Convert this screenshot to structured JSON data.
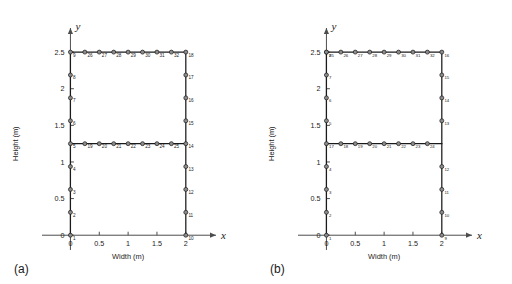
{
  "figure": {
    "type": "engineering-mesh-diagram",
    "panels": [
      {
        "tag": "(a)",
        "x_axis": {
          "letter": "x",
          "title": "Width (m)",
          "ticks": [
            "0",
            "0.5",
            "1",
            "1.5",
            "2"
          ],
          "tick_values": [
            0,
            0.5,
            1,
            1.5,
            2
          ],
          "range": [
            -0.25,
            2.35
          ]
        },
        "y_axis": {
          "letter": "y",
          "title": "Height (m)",
          "ticks": [
            "0",
            "0.5",
            "1",
            "1.5",
            "2",
            "2.5"
          ],
          "tick_values": [
            0,
            0.5,
            1,
            1.5,
            2,
            2.5
          ],
          "range": [
            -0.12,
            2.72
          ]
        },
        "nodes": [
          {
            "label": "1",
            "x": 0,
            "y": 0.0
          },
          {
            "label": "2",
            "x": 0,
            "y": 0.3125
          },
          {
            "label": "3",
            "x": 0,
            "y": 0.625
          },
          {
            "label": "4",
            "x": 0,
            "y": 0.9375
          },
          {
            "label": "5",
            "x": 0,
            "y": 1.25
          },
          {
            "label": "6",
            "x": 0,
            "y": 1.5625
          },
          {
            "label": "7",
            "x": 0,
            "y": 1.875
          },
          {
            "label": "8",
            "x": 0,
            "y": 2.1875
          },
          {
            "label": "9",
            "x": 0,
            "y": 2.5
          },
          {
            "label": "10",
            "x": 2,
            "y": 0.0
          },
          {
            "label": "11",
            "x": 2,
            "y": 0.3125
          },
          {
            "label": "12",
            "x": 2,
            "y": 0.625
          },
          {
            "label": "13",
            "x": 2,
            "y": 0.9375
          },
          {
            "label": "14",
            "x": 2,
            "y": 1.25
          },
          {
            "label": "15",
            "x": 2,
            "y": 1.5625
          },
          {
            "label": "16",
            "x": 2,
            "y": 1.875
          },
          {
            "label": "17",
            "x": 2,
            "y": 2.1875
          },
          {
            "label": "18",
            "x": 2,
            "y": 2.5
          },
          {
            "label": "19",
            "x": 0.25,
            "y": 1.25
          },
          {
            "label": "20",
            "x": 0.5,
            "y": 1.25
          },
          {
            "label": "21",
            "x": 0.75,
            "y": 1.25
          },
          {
            "label": "22",
            "x": 1.0,
            "y": 1.25
          },
          {
            "label": "23",
            "x": 1.25,
            "y": 1.25
          },
          {
            "label": "24",
            "x": 1.5,
            "y": 1.25
          },
          {
            "label": "25",
            "x": 1.75,
            "y": 1.25
          },
          {
            "label": "26",
            "x": 0.25,
            "y": 2.5
          },
          {
            "label": "27",
            "x": 0.5,
            "y": 2.5
          },
          {
            "label": "28",
            "x": 0.75,
            "y": 2.5
          },
          {
            "label": "29",
            "x": 1.0,
            "y": 2.5
          },
          {
            "label": "30",
            "x": 1.25,
            "y": 2.5
          },
          {
            "label": "31",
            "x": 1.5,
            "y": 2.5
          },
          {
            "label": "32",
            "x": 1.75,
            "y": 2.5
          }
        ],
        "members": [
          {
            "x1": 0,
            "y1": 0,
            "x2": 0,
            "y2": 2.5
          },
          {
            "x1": 2,
            "y1": 0,
            "x2": 2,
            "y2": 2.5
          },
          {
            "x1": 0,
            "y1": 1.25,
            "x2": 2,
            "y2": 1.25
          },
          {
            "x1": 0,
            "y1": 2.5,
            "x2": 2,
            "y2": 2.5
          }
        ]
      },
      {
        "tag": "(b)",
        "x_axis": {
          "letter": "x",
          "title": "Width (m)",
          "ticks": [
            "0",
            "0.5",
            "1",
            "1.5",
            "2"
          ],
          "tick_values": [
            0,
            0.5,
            1,
            1.5,
            2
          ],
          "range": [
            -0.25,
            2.35
          ]
        },
        "y_axis": {
          "letter": "y",
          "title": "Height (m)",
          "ticks": [
            "0",
            "0.5",
            "1",
            "1.5",
            "2",
            "2.5"
          ],
          "tick_values": [
            0,
            0.5,
            1,
            1.5,
            2,
            2.5
          ],
          "range": [
            -0.12,
            2.72
          ]
        },
        "nodes": [
          {
            "label": "1",
            "x": 0,
            "y": 0.0
          },
          {
            "label": "2",
            "x": 0,
            "y": 0.3125
          },
          {
            "label": "3",
            "x": 0,
            "y": 0.625
          },
          {
            "label": "4",
            "x": 0,
            "y": 0.9375
          },
          {
            "label": "5",
            "x": 0,
            "y": 1.5625
          },
          {
            "label": "6",
            "x": 0,
            "y": 1.875
          },
          {
            "label": "7",
            "x": 0,
            "y": 2.1875
          },
          {
            "label": "8",
            "x": 0,
            "y": 2.5
          },
          {
            "label": "9",
            "x": 2,
            "y": 0.0
          },
          {
            "label": "10",
            "x": 2,
            "y": 0.3125
          },
          {
            "label": "11",
            "x": 2,
            "y": 0.625
          },
          {
            "label": "12",
            "x": 2,
            "y": 0.9375
          },
          {
            "label": "13",
            "x": 2,
            "y": 1.5625
          },
          {
            "label": "14",
            "x": 2,
            "y": 1.875
          },
          {
            "label": "15",
            "x": 2,
            "y": 2.1875
          },
          {
            "label": "16",
            "x": 2,
            "y": 2.5
          },
          {
            "label": "17",
            "x": 0,
            "y": 1.25
          },
          {
            "label": "18",
            "x": 0.25,
            "y": 1.25
          },
          {
            "label": "19",
            "x": 0.5,
            "y": 1.25
          },
          {
            "label": "20",
            "x": 0.75,
            "y": 1.25
          },
          {
            "label": "21",
            "x": 1.0,
            "y": 1.25
          },
          {
            "label": "22",
            "x": 1.25,
            "y": 1.25
          },
          {
            "label": "23",
            "x": 1.5,
            "y": 1.25
          },
          {
            "label": "24",
            "x": 1.75,
            "y": 1.25
          },
          {
            "label": "25",
            "x": 0,
            "y": 2.5
          },
          {
            "label": "26",
            "x": 0.25,
            "y": 2.5
          },
          {
            "label": "27",
            "x": 0.5,
            "y": 2.5
          },
          {
            "label": "28",
            "x": 0.75,
            "y": 2.5
          },
          {
            "label": "29",
            "x": 1.0,
            "y": 2.5
          },
          {
            "label": "30",
            "x": 1.25,
            "y": 2.5
          },
          {
            "label": "31",
            "x": 1.5,
            "y": 2.5
          },
          {
            "label": "32",
            "x": 1.75,
            "y": 2.5
          }
        ],
        "members": [
          {
            "x1": 0,
            "y1": 0,
            "x2": 0,
            "y2": 2.5
          },
          {
            "x1": 2,
            "y1": 0,
            "x2": 2,
            "y2": 2.5
          },
          {
            "x1": 0,
            "y1": 1.25,
            "x2": 2,
            "y2": 1.25
          },
          {
            "x1": 0,
            "y1": 2.5,
            "x2": 2,
            "y2": 2.5
          }
        ]
      }
    ],
    "colors": {
      "line": "#1a1a1a",
      "node_fill": "#8c8c8c",
      "node_stroke": "#1a1a1a",
      "axis": "#4d4d4d",
      "text": "#1a1a1a",
      "background": "#ffffff"
    }
  }
}
